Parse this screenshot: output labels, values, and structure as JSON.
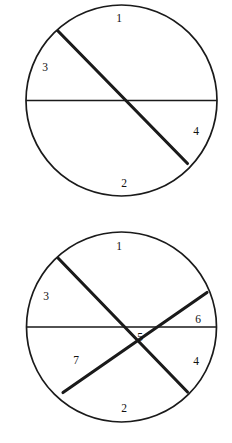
{
  "figure": {
    "canvas": {
      "width": 232,
      "height": 443
    },
    "colors": {
      "background": "#ffffff",
      "stroke": "#1a1a1a",
      "label": "#111111"
    }
  },
  "diagrams": [
    {
      "id": "circle-top",
      "name": "four-region-circle",
      "center": {
        "x": 121.5,
        "y": 100.5
      },
      "radius": 95.5,
      "chords": [
        {
          "name": "horizontal-diameter",
          "weight": "thin",
          "x1": 26.0,
          "y1": 100.5,
          "x2": 217.0,
          "y2": 100.5
        },
        {
          "name": "northwest-southeast-chord",
          "weight": "thick",
          "x1": 57.0,
          "y1": 30.0,
          "x2": 187.5,
          "y2": 163.5
        }
      ],
      "labels": [
        {
          "text": "1",
          "x": 119,
          "y": 19
        },
        {
          "text": "3",
          "x": 45,
          "y": 68
        },
        {
          "text": "4",
          "x": 196,
          "y": 132
        },
        {
          "text": "2",
          "x": 124,
          "y": 184
        }
      ]
    },
    {
      "id": "circle-bottom",
      "name": "seven-region-circle",
      "center": {
        "x": 121.5,
        "y": 327.0
      },
      "radius": 95.0,
      "chords": [
        {
          "name": "horizontal-diameter",
          "weight": "thin",
          "x1": 27.0,
          "y1": 327.0,
          "x2": 216.5,
          "y2": 327.0
        },
        {
          "name": "northwest-southeast-chord",
          "weight": "thick",
          "x1": 58.0,
          "y1": 258.0,
          "x2": 187.5,
          "y2": 392.0
        },
        {
          "name": "southwest-northeast-chord",
          "weight": "thick",
          "x1": 63.0,
          "y1": 392.5,
          "x2": 207.0,
          "y2": 292.5
        }
      ],
      "labels": [
        {
          "text": "1",
          "x": 119,
          "y": 247
        },
        {
          "text": "3",
          "x": 46,
          "y": 297
        },
        {
          "text": "6",
          "x": 198,
          "y": 320
        },
        {
          "text": "5",
          "x": 140,
          "y": 338
        },
        {
          "text": "7",
          "x": 76,
          "y": 361
        },
        {
          "text": "4",
          "x": 196,
          "y": 362
        },
        {
          "text": "2",
          "x": 124,
          "y": 409
        }
      ]
    }
  ]
}
